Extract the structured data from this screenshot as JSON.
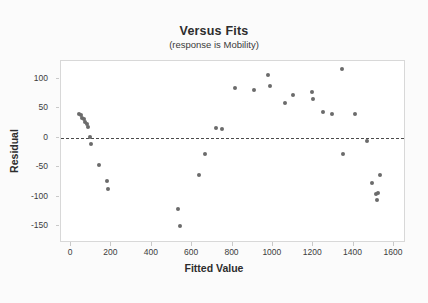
{
  "chart_data": {
    "type": "scatter",
    "title": "Versus Fits",
    "subtitle": "(response is Mobility)",
    "xlabel": "Fitted Value",
    "ylabel": "Residual",
    "xlim": [
      -50,
      1650
    ],
    "ylim": [
      -175,
      130
    ],
    "xticks": [
      0,
      200,
      400,
      600,
      800,
      1000,
      1200,
      1400,
      1600
    ],
    "xtick_labels": [
      "0",
      "200",
      "400",
      "600",
      "800",
      "1000",
      "1200",
      "1400",
      "1600"
    ],
    "yticks": [
      100,
      50,
      0,
      -50,
      -100,
      -150
    ],
    "ytick_labels": [
      "100",
      "50",
      "0",
      "-50",
      "-100",
      "-150"
    ],
    "grid": false,
    "reference_line": {
      "y": 0,
      "style": "dashed",
      "color": "#4a4a4a"
    },
    "marker": {
      "shape": "circle",
      "color": "#6b6b6b",
      "size": 4
    },
    "points": [
      {
        "x": 40,
        "y": 41
      },
      {
        "x": 48,
        "y": 38
      },
      {
        "x": 56,
        "y": 34
      },
      {
        "x": 62,
        "y": 31
      },
      {
        "x": 70,
        "y": 27
      },
      {
        "x": 78,
        "y": 23
      },
      {
        "x": 86,
        "y": 19
      },
      {
        "x": 95,
        "y": 1
      },
      {
        "x": 100,
        "y": -11
      },
      {
        "x": 140,
        "y": -46
      },
      {
        "x": 176,
        "y": -74
      },
      {
        "x": 182,
        "y": -87
      },
      {
        "x": 530,
        "y": -120
      },
      {
        "x": 540,
        "y": -150
      },
      {
        "x": 635,
        "y": -64
      },
      {
        "x": 665,
        "y": -27
      },
      {
        "x": 718,
        "y": 16
      },
      {
        "x": 748,
        "y": 15
      },
      {
        "x": 812,
        "y": 84
      },
      {
        "x": 905,
        "y": 81
      },
      {
        "x": 975,
        "y": 106
      },
      {
        "x": 988,
        "y": 87
      },
      {
        "x": 1062,
        "y": 59
      },
      {
        "x": 1102,
        "y": 73
      },
      {
        "x": 1196,
        "y": 77
      },
      {
        "x": 1200,
        "y": 66
      },
      {
        "x": 1248,
        "y": 44
      },
      {
        "x": 1292,
        "y": 40
      },
      {
        "x": 1342,
        "y": 116
      },
      {
        "x": 1348,
        "y": -27
      },
      {
        "x": 1405,
        "y": 41
      },
      {
        "x": 1468,
        "y": -6
      },
      {
        "x": 1492,
        "y": -76
      },
      {
        "x": 1530,
        "y": -64
      },
      {
        "x": 1512,
        "y": -96
      },
      {
        "x": 1522,
        "y": -93
      },
      {
        "x": 1518,
        "y": -105
      }
    ]
  }
}
